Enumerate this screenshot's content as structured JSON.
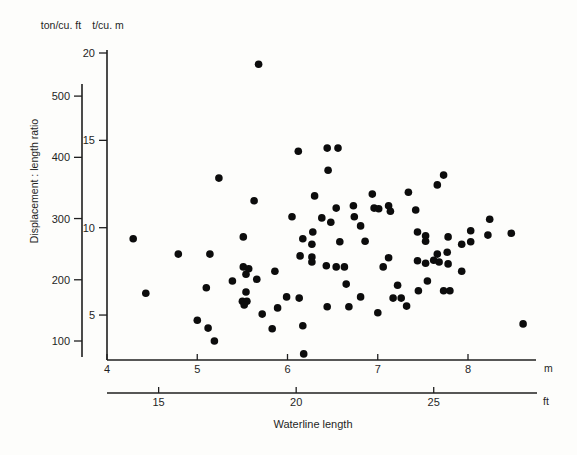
{
  "page": {
    "background": "#fdfdfb",
    "ink": "#1f1f1f"
  },
  "labels": {
    "left_unit_top": "ton/cu. ft",
    "right_unit_top": "t/cu. m",
    "y_axis_title": "Displacement : length ratio",
    "x_axis_title": "Waterline length",
    "x_unit_m": "m",
    "x_unit_ft": "ft"
  },
  "chart_data": {
    "type": "scatter",
    "title": "",
    "xlabel": "Waterline length",
    "ylabel": "Displacement : length ratio",
    "grid": false,
    "legend": null,
    "marker": {
      "shape": "circle",
      "color": "#0c0c0c",
      "radius_px": 3.8
    },
    "x_axes": [
      {
        "unit": "m",
        "ticks": [
          4,
          5,
          6,
          7,
          8
        ],
        "range": [
          4,
          8.75
        ]
      },
      {
        "unit": "ft",
        "ticks": [
          15,
          20,
          25
        ],
        "range": [
          13.1,
          28.7
        ]
      }
    ],
    "y_axes": [
      {
        "unit": "ton/cu. ft",
        "ticks": [
          100,
          200,
          300,
          400,
          500
        ],
        "range": [
          72,
          565
        ]
      },
      {
        "unit": "t/cu. m",
        "ticks": [
          5,
          10,
          15,
          20
        ],
        "range": [
          2.6,
          20.2
        ]
      }
    ],
    "points_format": "[waterline_length_m, displacement_length_ratio_ton_per_cu_ft]",
    "points": [
      [
        5.68,
        552
      ],
      [
        6.12,
        410
      ],
      [
        6.44,
        415
      ],
      [
        6.56,
        415
      ],
      [
        6.45,
        379
      ],
      [
        7.73,
        371
      ],
      [
        5.24,
        366
      ],
      [
        7.66,
        355
      ],
      [
        7.34,
        343
      ],
      [
        6.94,
        340
      ],
      [
        6.3,
        337
      ],
      [
        5.63,
        329
      ],
      [
        6.73,
        321
      ],
      [
        7.12,
        321
      ],
      [
        6.54,
        317
      ],
      [
        6.96,
        317
      ],
      [
        7.01,
        316
      ],
      [
        7.14,
        312
      ],
      [
        7.42,
        314
      ],
      [
        6.74,
        303
      ],
      [
        6.05,
        303
      ],
      [
        6.38,
        301
      ],
      [
        8.24,
        299
      ],
      [
        6.48,
        294
      ],
      [
        6.81,
        288
      ],
      [
        8.03,
        280
      ],
      [
        7.44,
        278
      ],
      [
        8.48,
        276
      ],
      [
        6.28,
        278
      ],
      [
        7.53,
        272
      ],
      [
        5.51,
        270
      ],
      [
        7.78,
        270
      ],
      [
        4.29,
        267
      ],
      [
        6.17,
        267
      ],
      [
        7.53,
        263
      ],
      [
        6.86,
        263
      ],
      [
        6.58,
        262
      ],
      [
        8.03,
        262
      ],
      [
        6.27,
        258
      ],
      [
        8.22,
        273
      ],
      [
        7.93,
        258
      ],
      [
        4.79,
        242
      ],
      [
        5.14,
        242
      ],
      [
        6.14,
        239
      ],
      [
        6.27,
        237
      ],
      [
        7.12,
        236
      ],
      [
        7.66,
        242
      ],
      [
        7.77,
        245
      ],
      [
        6.27,
        229
      ],
      [
        6.43,
        223
      ],
      [
        6.54,
        221
      ],
      [
        6.63,
        221
      ],
      [
        7.06,
        221
      ],
      [
        7.44,
        231
      ],
      [
        7.53,
        227
      ],
      [
        7.62,
        232
      ],
      [
        7.68,
        229
      ],
      [
        7.78,
        226
      ],
      [
        7.93,
        214
      ],
      [
        7.55,
        198
      ],
      [
        5.51,
        221
      ],
      [
        5.57,
        218
      ],
      [
        5.54,
        209
      ],
      [
        5.66,
        201
      ],
      [
        5.39,
        198
      ],
      [
        5.86,
        214
      ],
      [
        5.1,
        187
      ],
      [
        4.43,
        178
      ],
      [
        6.65,
        193
      ],
      [
        7.22,
        191
      ],
      [
        5.54,
        180
      ],
      [
        5.99,
        172
      ],
      [
        6.13,
        170
      ],
      [
        6.81,
        172
      ],
      [
        7.45,
        182
      ],
      [
        7.73,
        182
      ],
      [
        7.8,
        182
      ],
      [
        5.5,
        165
      ],
      [
        5.55,
        165
      ],
      [
        5.52,
        159
      ],
      [
        6.44,
        156
      ],
      [
        6.68,
        156
      ],
      [
        5.89,
        154
      ],
      [
        7.17,
        170
      ],
      [
        7.26,
        170
      ],
      [
        7.32,
        157
      ],
      [
        5.72,
        144
      ],
      [
        5.83,
        120
      ],
      [
        6.17,
        125
      ],
      [
        5.0,
        134
      ],
      [
        5.12,
        121
      ],
      [
        5.19,
        100
      ],
      [
        7.0,
        146
      ],
      [
        6.18,
        79
      ],
      [
        8.61,
        128
      ]
    ]
  }
}
